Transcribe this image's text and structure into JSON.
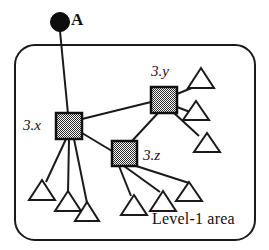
{
  "figure": {
    "type": "network-topology-diagram",
    "title": "",
    "background_color": "#ffffff",
    "stroke_color": "#1a1a1a",
    "node_fill_pattern": "checkered-gray",
    "node_fill_color": "#8c8c8c"
  },
  "labels": {
    "external_node": "A",
    "router_x": "3.x",
    "router_y": "3.y",
    "router_z": "3.z",
    "area_boundary": "Level-1 area"
  },
  "nodes": {
    "external": {
      "id": "A",
      "shape": "filled-circle",
      "label": "A",
      "cx": 60,
      "cy": 22,
      "r": 9
    },
    "routers": [
      {
        "id": "3.x",
        "shape": "square",
        "label": "3.x",
        "x": 56,
        "y": 113,
        "size": 26,
        "label_x": 23,
        "label_y": 118
      },
      {
        "id": "3.y",
        "shape": "square",
        "label": "3.y",
        "x": 151,
        "y": 87,
        "size": 26,
        "label_x": 152,
        "label_y": 66
      },
      {
        "id": "3.z",
        "shape": "square",
        "label": "3.z",
        "x": 112,
        "y": 141,
        "size": 25,
        "label_x": 143,
        "label_y": 150
      }
    ],
    "leaves": [
      {
        "id": "leaf-x-1",
        "shape": "triangle",
        "parent": "3.x",
        "cx": 42,
        "cy": 191
      },
      {
        "id": "leaf-x-2",
        "shape": "triangle",
        "parent": "3.x",
        "cx": 68,
        "cy": 201
      },
      {
        "id": "leaf-x-3",
        "shape": "triangle",
        "parent": "3.x",
        "cx": 87,
        "cy": 212
      },
      {
        "id": "leaf-z-1",
        "shape": "triangle",
        "parent": "3.z",
        "cx": 134,
        "cy": 205
      },
      {
        "id": "leaf-z-2",
        "shape": "triangle",
        "parent": "3.z",
        "cx": 163,
        "cy": 201
      },
      {
        "id": "leaf-z-3",
        "shape": "triangle",
        "parent": "3.z",
        "cx": 189,
        "cy": 191
      },
      {
        "id": "leaf-y-1",
        "shape": "triangle",
        "parent": "3.y",
        "cx": 201,
        "cy": 78
      },
      {
        "id": "leaf-y-2",
        "shape": "triangle",
        "parent": "3.y",
        "cx": 196,
        "cy": 110
      },
      {
        "id": "leaf-y-3",
        "shape": "triangle",
        "parent": "3.y",
        "cx": 207,
        "cy": 142
      }
    ]
  },
  "links": [
    {
      "id": "link-A-3x",
      "from": "A",
      "to": "3.x",
      "crosses_boundary": true
    },
    {
      "id": "link-3x-3y",
      "from": "3.x",
      "to": "3.y",
      "crosses_boundary": false
    },
    {
      "id": "link-3x-3z",
      "from": "3.x",
      "to": "3.z",
      "crosses_boundary": false
    },
    {
      "id": "link-3y-3z",
      "from": "3.y",
      "to": "3.z",
      "crosses_boundary": false
    },
    {
      "id": "link-3x-leaf1",
      "from": "3.x",
      "to": "leaf-x-1",
      "crosses_boundary": false
    },
    {
      "id": "link-3x-leaf2",
      "from": "3.x",
      "to": "leaf-x-2",
      "crosses_boundary": false
    },
    {
      "id": "link-3x-leaf3",
      "from": "3.x",
      "to": "leaf-x-3",
      "crosses_boundary": false
    },
    {
      "id": "link-3z-leaf1",
      "from": "3.z",
      "to": "leaf-z-1",
      "crosses_boundary": false
    },
    {
      "id": "link-3z-leaf2",
      "from": "3.z",
      "to": "leaf-z-2",
      "crosses_boundary": false
    },
    {
      "id": "link-3z-leaf3",
      "from": "3.z",
      "to": "leaf-z-3",
      "crosses_boundary": false
    },
    {
      "id": "link-3y-leaf1",
      "from": "3.y",
      "to": "leaf-y-1",
      "crosses_boundary": false
    },
    {
      "id": "link-3y-leaf2",
      "from": "3.y",
      "to": "leaf-y-2",
      "crosses_boundary": false
    },
    {
      "id": "link-3y-leaf3",
      "from": "3.y",
      "to": "leaf-y-3",
      "crosses_boundary": false
    }
  ],
  "boundary": {
    "shape": "rounded-rectangle",
    "x": 15,
    "y": 45,
    "width": 240,
    "height": 195,
    "radius": 20,
    "label": "Level-1 area",
    "label_x": 152,
    "label_y": 218
  }
}
